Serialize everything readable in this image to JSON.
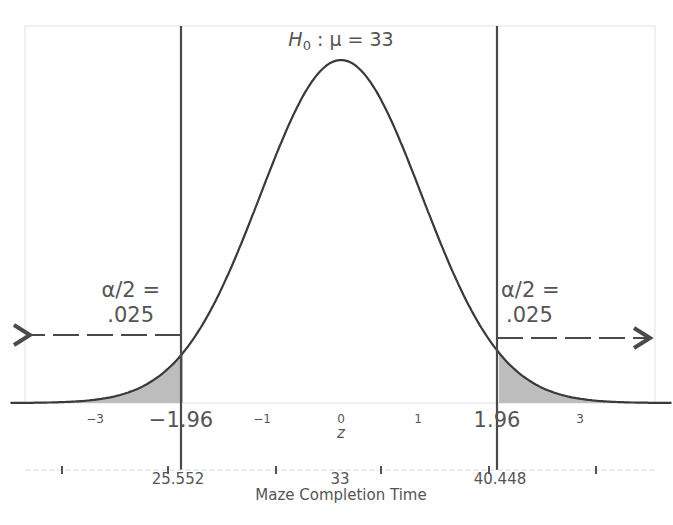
{
  "chart_data": {
    "type": "area",
    "title_parts": {
      "h": "H",
      "sub": "0",
      "rest": " : μ = 33"
    },
    "distribution": "standard normal",
    "xlabel_z": "z",
    "xlabel_raw": "Maze Completion Time",
    "z_ticks": [
      {
        "value": -3,
        "label": "−3"
      },
      {
        "value": -1,
        "label": "−1"
      },
      {
        "value": 0,
        "label": "0"
      },
      {
        "value": 1,
        "label": "1"
      },
      {
        "value": 3,
        "label": "3"
      }
    ],
    "critical_values": [
      {
        "z": -1.96,
        "z_label": "−1.96",
        "raw": 25.552,
        "raw_label": "25.552"
      },
      {
        "z": 1.96,
        "z_label": "1.96",
        "raw": 40.448,
        "raw_label": "40.448"
      }
    ],
    "raw_mean": {
      "value": 33,
      "label": "33"
    },
    "raw_minor_ticks_z": [
      -3.5,
      -2.5,
      -0.5,
      0.5,
      2.5,
      3.5
    ],
    "rejection_regions": [
      {
        "side": "left",
        "label_line1": "α/2 =",
        "label_line2": ".025",
        "area": 0.025,
        "from_z": -4,
        "to_z": -1.96
      },
      {
        "side": "right",
        "label_line1": "α/2 =",
        "label_line2": ".025",
        "area": 0.025,
        "from_z": 1.96,
        "to_z": 4
      }
    ],
    "xlim": [
      -4.1,
      4.1
    ],
    "colors": {
      "curve": "#3a3a3a",
      "shade": "#bdbdbd",
      "critical_line": "#4a4a4a",
      "frame": "#e2e2e2",
      "text": "#555555"
    }
  }
}
